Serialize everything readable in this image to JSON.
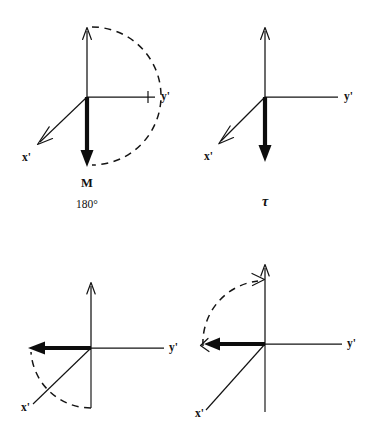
{
  "figure": {
    "background_color": "#ffffff",
    "ink_color": "#111111"
  },
  "panels": [
    {
      "id": "panel-top-left",
      "origin": {
        "x": 87,
        "y": 97
      },
      "axes": {
        "z": {
          "label": "",
          "tip": {
            "x": 87,
            "y": 26
          },
          "arrowhead": "open"
        },
        "y_prime": {
          "label": "y'",
          "label_pos": {
            "x": 161,
            "y": 99
          },
          "tip": {
            "x": 155,
            "y": 97
          },
          "arrowhead": "none",
          "tick": true
        },
        "x_prime": {
          "label": "x'",
          "label_pos": {
            "x": 22,
            "y": 158
          },
          "tip": {
            "x": 38,
            "y": 143
          },
          "arrowhead": "open"
        }
      },
      "magnetization_vector": {
        "name": "M",
        "direction": "down",
        "style": "bold",
        "tip": {
          "x": 87,
          "y": 165
        }
      },
      "rotation_arc": {
        "present": true,
        "style": "dashed",
        "from": "+z",
        "to": "-z",
        "sweep": "clockwise-right-half",
        "radius": 69
      },
      "captions": [
        {
          "text": "M",
          "style": "bold",
          "pos": {
            "x": 87,
            "y": 184
          }
        },
        {
          "text": "180°",
          "style": "regular",
          "pos": {
            "x": 87,
            "y": 205
          }
        }
      ]
    },
    {
      "id": "panel-top-right",
      "origin": {
        "x": 265,
        "y": 97
      },
      "axes": {
        "z": {
          "label": "",
          "tip": {
            "x": 265,
            "y": 26
          },
          "arrowhead": "open"
        },
        "y_prime": {
          "label": "y'",
          "label_pos": {
            "x": 344,
            "y": 99
          },
          "tip": {
            "x": 338,
            "y": 97
          },
          "arrowhead": "none",
          "tick": false
        },
        "x_prime": {
          "label": "x'",
          "label_pos": {
            "x": 203,
            "y": 158
          },
          "tip": {
            "x": 219,
            "y": 143
          },
          "arrowhead": "open"
        }
      },
      "magnetization_vector": {
        "name": "M",
        "direction": "down",
        "style": "bold",
        "tip": {
          "x": 265,
          "y": 160
        }
      },
      "rotation_arc": {
        "present": false
      },
      "captions": [
        {
          "text": "τ",
          "style": "tau",
          "pos": {
            "x": 265,
            "y": 202
          }
        }
      ]
    },
    {
      "id": "panel-bottom-left",
      "origin": {
        "x": 91,
        "y": 348
      },
      "axes": {
        "z": {
          "label": "",
          "tip": {
            "x": 91,
            "y": 281
          },
          "arrowhead": "open"
        },
        "y_prime": {
          "label": "y'",
          "label_pos": {
            "x": 169,
            "y": 350
          },
          "tip": {
            "x": 164,
            "y": 348
          },
          "arrowhead": "none",
          "tick": false
        },
        "x_prime": {
          "label": "x'",
          "label_pos": {
            "x": 22,
            "y": 409
          },
          "tip": {
            "x": 33,
            "y": 404
          },
          "arrowhead": "none"
        }
      },
      "magnetization_vector": {
        "name": "M",
        "direction": "left",
        "style": "bold",
        "tip": {
          "x": 29,
          "y": 348
        }
      },
      "rotation_arc": {
        "present": true,
        "style": "dashed",
        "from": "-z",
        "to": "-y'",
        "sweep": "counterclockwise",
        "radius": 60
      },
      "captions": []
    },
    {
      "id": "panel-bottom-right",
      "origin": {
        "x": 265,
        "y": 344
      },
      "axes": {
        "z": {
          "label": "",
          "tip": {
            "x": 265,
            "y": 263
          },
          "arrowhead": "open"
        },
        "y_prime": {
          "label": "y'",
          "label_pos": {
            "x": 347,
            "y": 346
          },
          "tip": {
            "x": 342,
            "y": 344
          },
          "arrowhead": "none",
          "tick": false
        },
        "x_prime": {
          "label": "x'",
          "label_pos": {
            "x": 196,
            "y": 414
          },
          "tip": {
            "x": 206,
            "y": 410
          },
          "arrowhead": "none"
        }
      },
      "magnetization_vector": {
        "name": "M",
        "direction": "left",
        "style": "bold",
        "tip": {
          "x": 204,
          "y": 344
        }
      },
      "rotation_arc": {
        "present": true,
        "style": "dashed",
        "from": "-y'",
        "to": "+z",
        "sweep": "counterclockwise",
        "radius": 62
      },
      "captions": []
    }
  ],
  "labels": {
    "y_prime": "y'",
    "x_prime": "x'",
    "magnetization": "M",
    "flip_angle": "180°",
    "tau": "τ"
  }
}
